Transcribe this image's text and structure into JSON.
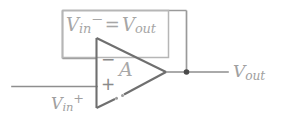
{
  "diagram": {
    "annotation": {
      "name": "feedback-relation",
      "v_symbol": "V",
      "v_sub": "in",
      "v_sup": "−",
      "equals": "=",
      "v2_symbol": "V",
      "v2_sub": "out",
      "full_text": "V in − = V out"
    },
    "amplifier": {
      "gain_label": "A",
      "inverting_pin": "−",
      "noninverting_pin": "+",
      "shape": "triangle"
    },
    "terminals": [
      {
        "name": "input-noninverting",
        "v_symbol": "V",
        "v_sub": "in",
        "v_sup": "+",
        "full_text": "V in +"
      },
      {
        "name": "output",
        "v_symbol": "V",
        "v_sub": "out",
        "v_sup": "",
        "full_text": "V out"
      }
    ],
    "colors": {
      "background": "#ffffff",
      "wire": "#8e8e8e",
      "triangle_stroke": "#6f6f6f",
      "annotation_box": "#b6b6b6",
      "label_text": "#a0a0a0",
      "junction_dot": "#4a4a4a"
    }
  }
}
